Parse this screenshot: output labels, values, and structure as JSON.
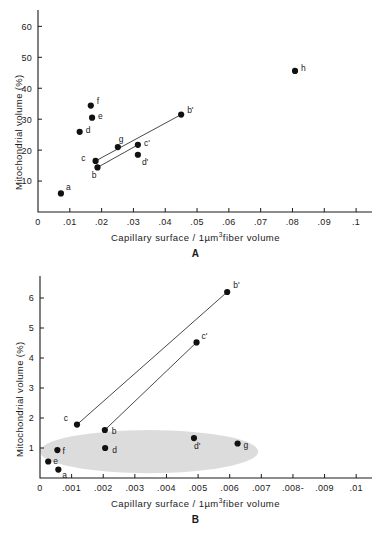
{
  "figure": {
    "axis_titles": {
      "x_prefix": "Capillary surface / 1µm",
      "x_sup": "3",
      "x_suffix": "fiber volume",
      "y": "Mitochondrial volume (%)"
    }
  },
  "chart_data": [
    {
      "type": "scatter",
      "panel": "A",
      "title": "A",
      "xlabel": "Capillary surface / 1µm3 fiber volume",
      "ylabel": "Mitochondrial volume (%)",
      "xlim": [
        0,
        0.105
      ],
      "ylim": [
        0,
        64
      ],
      "xticks": [
        0,
        0.01,
        0.02,
        0.03,
        0.04,
        0.05,
        0.06,
        0.07,
        0.08,
        0.09,
        0.1
      ],
      "xtick_labels": [
        "0",
        ".01",
        ".02",
        ".03",
        ".04",
        ".05",
        ".06",
        ".07",
        ".08",
        ".09",
        ".1"
      ],
      "yticks": [
        10,
        20,
        30,
        40,
        50,
        60
      ],
      "ytick_labels": [
        "10",
        "20",
        "30",
        "40",
        "50",
        "60"
      ],
      "grid": false,
      "legend": "none",
      "points": [
        {
          "label": "a",
          "x": 0.0072,
          "y": 6.0
        },
        {
          "label": "d",
          "x": 0.0131,
          "y": 25.9
        },
        {
          "label": "f",
          "x": 0.0166,
          "y": 34.4
        },
        {
          "label": "e",
          "x": 0.017,
          "y": 30.5
        },
        {
          "label": "c",
          "x": 0.0181,
          "y": 16.5
        },
        {
          "label": "b",
          "x": 0.0187,
          "y": 14.4
        },
        {
          "label": "g",
          "x": 0.0251,
          "y": 21.0
        },
        {
          "label": "c'",
          "x": 0.0314,
          "y": 21.7
        },
        {
          "label": "d'",
          "x": 0.0314,
          "y": 18.5
        },
        {
          "label": "b'",
          "x": 0.045,
          "y": 31.5
        },
        {
          "label": "h",
          "x": 0.0808,
          "y": 45.6
        }
      ],
      "connectors": [
        {
          "from": "c",
          "to": "b'"
        },
        {
          "from": "b",
          "to": "c'"
        }
      ],
      "shaded_region": null
    },
    {
      "type": "scatter",
      "panel": "B",
      "title": "B",
      "xlabel": "Capillary surface / 1µm3 fiber volume",
      "ylabel": "Mitochondrial volume (%)",
      "xlim": [
        0,
        0.0105
      ],
      "ylim": [
        0,
        6.6
      ],
      "xticks": [
        0,
        0.001,
        0.002,
        0.003,
        0.004,
        0.005,
        0.006,
        0.007,
        0.008,
        0.009,
        0.01
      ],
      "xtick_labels": [
        "0",
        ".001",
        ".002",
        ".003",
        ".004",
        ".005",
        ".006",
        ".007",
        ".008-",
        ".009",
        ".01"
      ],
      "yticks": [
        1,
        2,
        3,
        4,
        5,
        6
      ],
      "ytick_labels": [
        "1",
        "2",
        "3",
        "4",
        "5",
        "6"
      ],
      "grid": false,
      "legend": "none",
      "points": [
        {
          "label": "e",
          "x": 0.00026,
          "y": 0.55
        },
        {
          "label": "a",
          "x": 0.00058,
          "y": 0.28
        },
        {
          "label": "f",
          "x": 0.00055,
          "y": 0.93
        },
        {
          "label": "c",
          "x": 0.00117,
          "y": 1.78
        },
        {
          "label": "b",
          "x": 0.00205,
          "y": 1.6
        },
        {
          "label": "d",
          "x": 0.00206,
          "y": 1.0
        },
        {
          "label": "d'",
          "x": 0.00487,
          "y": 1.33
        },
        {
          "label": "c'",
          "x": 0.00495,
          "y": 4.52
        },
        {
          "label": "b'",
          "x": 0.00592,
          "y": 6.2
        },
        {
          "label": "g",
          "x": 0.00625,
          "y": 1.15
        }
      ],
      "connectors": [
        {
          "from": "c",
          "to": "b'"
        },
        {
          "from": "b",
          "to": "c'"
        }
      ],
      "shaded_region": {
        "shape": "ellipse",
        "center_x": 0.00345,
        "center_y": 0.88,
        "radius_x": 0.00345,
        "radius_y": 0.72,
        "color": "#cfcfcf"
      }
    }
  ]
}
